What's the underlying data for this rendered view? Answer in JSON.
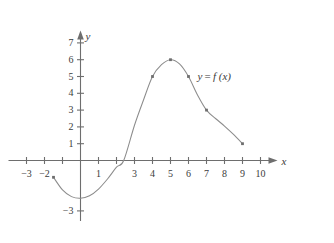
{
  "chart_data": {
    "type": "line",
    "title": "",
    "xlabel": "x",
    "ylabel": "y",
    "xlim": [
      -4,
      11
    ],
    "ylim": [
      -3.6,
      7.8
    ],
    "grid": false,
    "legend_position": "inline-right",
    "curve_label": "y = f (x)",
    "series": [
      {
        "name": "f",
        "marked_points": [
          {
            "x": -1.5,
            "y": -1
          },
          {
            "x": 4,
            "y": 5
          },
          {
            "x": 5,
            "y": 6
          },
          {
            "x": 6,
            "y": 5
          },
          {
            "x": 7,
            "y": 3
          },
          {
            "x": 9,
            "y": 1
          }
        ],
        "path_points": [
          {
            "x": -1.5,
            "y": -1
          },
          {
            "x": -1.0,
            "y": -1.75
          },
          {
            "x": -0.5,
            "y": -2.15
          },
          {
            "x": 0.0,
            "y": -2.25
          },
          {
            "x": 0.5,
            "y": -2.1
          },
          {
            "x": 1.0,
            "y": -1.7
          },
          {
            "x": 1.5,
            "y": -1.1
          },
          {
            "x": 2.0,
            "y": -0.4
          },
          {
            "x": 2.4,
            "y": 0
          },
          {
            "x": 3.0,
            "y": 2.1
          },
          {
            "x": 3.5,
            "y": 3.6
          },
          {
            "x": 4.0,
            "y": 5.0
          },
          {
            "x": 4.5,
            "y": 5.7
          },
          {
            "x": 5.0,
            "y": 6.0
          },
          {
            "x": 5.5,
            "y": 5.75
          },
          {
            "x": 6.0,
            "y": 5.0
          },
          {
            "x": 6.5,
            "y": 3.9
          },
          {
            "x": 7.0,
            "y": 3.0
          },
          {
            "x": 7.5,
            "y": 2.5
          },
          {
            "x": 8.0,
            "y": 2.05
          },
          {
            "x": 8.5,
            "y": 1.55
          },
          {
            "x": 9.0,
            "y": 1.0
          }
        ]
      }
    ],
    "x_ticks": [
      {
        "value": -3,
        "label": "−3"
      },
      {
        "value": -2,
        "label": "−2"
      },
      {
        "value": -1,
        "label": ""
      },
      {
        "value": 1,
        "label": "1"
      },
      {
        "value": 2,
        "label": ""
      },
      {
        "value": 3,
        "label": "3"
      },
      {
        "value": 4,
        "label": "4"
      },
      {
        "value": 5,
        "label": "5"
      },
      {
        "value": 6,
        "label": "6"
      },
      {
        "value": 7,
        "label": "7"
      },
      {
        "value": 8,
        "label": "8"
      },
      {
        "value": 9,
        "label": "9"
      },
      {
        "value": 10,
        "label": "10"
      }
    ],
    "y_ticks": [
      {
        "value": 7,
        "label": "7"
      },
      {
        "value": 6,
        "label": "6"
      },
      {
        "value": 5,
        "label": "5"
      },
      {
        "value": 4,
        "label": "4"
      },
      {
        "value": 3,
        "label": "3"
      },
      {
        "value": 2,
        "label": "2"
      },
      {
        "value": 1,
        "label": "1"
      },
      {
        "value": -3,
        "label": "−3"
      }
    ],
    "colors": {
      "curve": "#8c8c8c",
      "axis": "#6e6e6e",
      "text": "#3b3b3b",
      "marker": "#6e6e6e",
      "background": "#ffffff"
    }
  }
}
